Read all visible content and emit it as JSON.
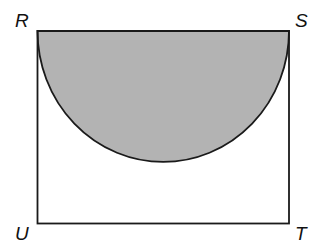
{
  "figure": {
    "type": "geometry",
    "colors": {
      "stroke": "#1a1a1a",
      "shade": "#b3b3b3",
      "background": "#ffffff"
    },
    "vertices": [
      {
        "label": "R",
        "position": "top-left"
      },
      {
        "label": "S",
        "position": "top-right"
      },
      {
        "label": "T",
        "position": "bottom-right"
      },
      {
        "label": "U",
        "position": "bottom-left"
      }
    ],
    "shaded_region": "semicircle with diameter RS"
  }
}
